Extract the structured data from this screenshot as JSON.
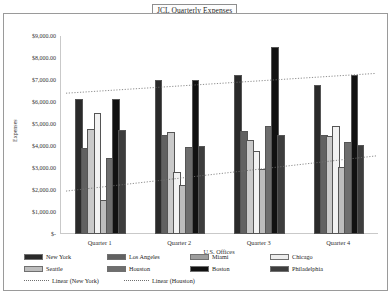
{
  "title": "JCL Quarterly Expenses",
  "chart_data": {
    "type": "bar",
    "title": "JCL Quarterly Expenses",
    "xlabel": "U.S. Offices",
    "ylabel": "Expenses",
    "categories": [
      "Quarter 1",
      "Quarter 2",
      "Quarter 3",
      "Quarter 4"
    ],
    "ylim": [
      0,
      9000
    ],
    "ytick_labels": [
      "$9,000.00",
      "$8,000.00",
      "$7,000.00",
      "$6,000.00",
      "$5,000.00",
      "$4,000.00",
      "$3,000.00",
      "$2,000.00",
      "$1,000.00",
      "$-"
    ],
    "ytick_values": [
      9000,
      8000,
      7000,
      6000,
      5000,
      4000,
      3000,
      2000,
      1000,
      0
    ],
    "grid": false,
    "legend_position": "bottom",
    "series": [
      {
        "name": "New York",
        "color": "#2a2a2a",
        "values": [
          6050,
          6900,
          7150,
          6700
        ]
      },
      {
        "name": "Los Angeles",
        "color": "#616161",
        "values": [
          3800,
          4400,
          4600,
          4400
        ]
      },
      {
        "name": "Miami",
        "color": "#c9c9c9",
        "values": [
          4700,
          4550,
          4200,
          4350
        ]
      },
      {
        "name": "Chicago",
        "color": "#f2f2f2",
        "values": [
          5400,
          2750,
          3700,
          4800
        ]
      },
      {
        "name": "Seattle",
        "color": "#bdbdbd",
        "values": [
          1450,
          2150,
          2850,
          2950
        ]
      },
      {
        "name": "Houston",
        "color": "#6e6e6e",
        "values": [
          3350,
          3850,
          4800,
          4100
        ]
      },
      {
        "name": "Boston",
        "color": "#111111",
        "values": [
          6050,
          6900,
          8400,
          7150
        ]
      },
      {
        "name": "Philadelphia",
        "color": "#3d3d3d",
        "values": [
          4650,
          3900,
          4400,
          3950
        ]
      }
    ],
    "trendlines": [
      {
        "name": "Linear (New York)",
        "start": 6400,
        "end": 7300,
        "style": "dotted"
      },
      {
        "name": "Linear (Houston)",
        "start": 1950,
        "end": 3550,
        "style": "dotted"
      }
    ]
  },
  "legend": {
    "rows": [
      [
        {
          "label": "New York",
          "swatch": "#2a2a2a",
          "kind": "box"
        },
        {
          "label": "Los Angeles",
          "swatch": "#616161",
          "kind": "box"
        },
        {
          "label": "Miami",
          "swatch": "#9d9d9d",
          "kind": "box"
        },
        {
          "label": "Chicago",
          "swatch": "#ededed",
          "kind": "box"
        }
      ],
      [
        {
          "label": "Seattle",
          "swatch": "#bdbdbd",
          "kind": "box"
        },
        {
          "label": "Houston",
          "swatch": "#6e6e6e",
          "kind": "box"
        },
        {
          "label": "Boston",
          "swatch": "#111111",
          "kind": "box"
        },
        {
          "label": "Philadelphia",
          "swatch": "#3d3d3d",
          "kind": "box"
        }
      ],
      [
        {
          "label": "Linear (New York)",
          "swatch": "#6f6f6f",
          "kind": "dash"
        },
        {
          "label": "Linear (Houston)",
          "swatch": "#6f6f6f",
          "kind": "dash"
        }
      ]
    ]
  }
}
